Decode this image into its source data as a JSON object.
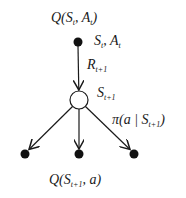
{
  "diagram": {
    "type": "backup-diagram",
    "colors": {
      "stroke": "#1a1a1a",
      "filled_node": "#111111",
      "open_node_fill": "#ffffff",
      "background": "#ffffff"
    },
    "nodes": [
      {
        "id": "state-action-t",
        "kind": "action-filled",
        "x": 78,
        "y": 42,
        "r": 4.5
      },
      {
        "id": "state-t1",
        "kind": "state-open",
        "x": 79,
        "y": 100,
        "r": 9
      },
      {
        "id": "action-left",
        "kind": "action-filled",
        "x": 25,
        "y": 154,
        "r": 4.5
      },
      {
        "id": "action-mid",
        "kind": "action-filled",
        "x": 79,
        "y": 154,
        "r": 4.5
      },
      {
        "id": "action-right",
        "kind": "action-filled",
        "x": 134,
        "y": 154,
        "r": 4.5
      }
    ],
    "edges": [
      {
        "from": "state-action-t",
        "to": "state-t1",
        "label": "R_{t+1}"
      },
      {
        "from": "state-t1",
        "to": "action-left"
      },
      {
        "from": "state-t1",
        "to": "action-mid"
      },
      {
        "from": "state-t1",
        "to": "action-right",
        "label": "π(a|S_{t+1})"
      }
    ],
    "labels": {
      "q_top": {
        "main": "Q(S",
        "sub1": "t",
        "mid": ", A",
        "sub2": "t",
        "end": ")"
      },
      "state_action": {
        "main": "S",
        "sub1": "t",
        "mid": ", A",
        "sub2": "t"
      },
      "reward": {
        "main": "R",
        "sub": "t+1"
      },
      "next_state": {
        "main": "S",
        "sub": "t+1"
      },
      "policy": {
        "main": "π(a | S",
        "sub": "t+1",
        "end": ")"
      },
      "q_bottom": {
        "main": "Q(S",
        "sub": "t+1",
        "end": ", a)"
      }
    }
  }
}
